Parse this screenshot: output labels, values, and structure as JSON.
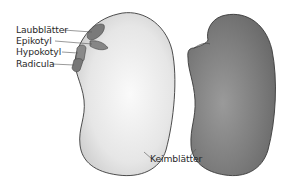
{
  "diagram": {
    "labels": {
      "laubblaetter": "Laubblätter",
      "epikotyl": "Epikotyl",
      "hypokotyl": "Hypokotyl",
      "radicula": "Radicula",
      "keimblaetter": "Keimblätter"
    },
    "colors": {
      "open_seed_fill": "#e6e6e6",
      "closed_seed_fill": "#7f7f7f",
      "embryo_fill": "#7a7a7a",
      "outline": "#3a3a3a",
      "leader_line": "#555555",
      "text": "#2a2a2a"
    }
  }
}
